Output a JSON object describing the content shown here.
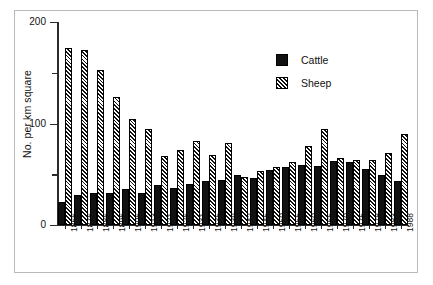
{
  "chart_data": {
    "type": "bar",
    "title": "",
    "xlabel": "",
    "ylabel": "No. per km square",
    "ylim": [
      0,
      200
    ],
    "yticks": [
      0,
      100,
      200
    ],
    "yticks_minor": [
      50,
      150
    ],
    "grid": false,
    "legend_position": "top-right",
    "categories": [
      "1866",
      "1876",
      "1886",
      "1896",
      "1906",
      "1913",
      "1921",
      "1926",
      "1931",
      "1935",
      "1939",
      "1942",
      "1945",
      "1950",
      "1955",
      "1960",
      "1965",
      "1970",
      "1975",
      "1978",
      "1983",
      "1988"
    ],
    "series": [
      {
        "name": "Cattle",
        "color": "#111111",
        "fill": "solid",
        "values": [
          23,
          30,
          32,
          32,
          35,
          32,
          39,
          36,
          40,
          43,
          44,
          49,
          46,
          54,
          57,
          59,
          58,
          63,
          62,
          55,
          49,
          43
        ]
      },
      {
        "name": "Sheep",
        "color": "#111111",
        "fill": "diagonal-hatch",
        "values": [
          174,
          172,
          153,
          126,
          104,
          95,
          68,
          74,
          83,
          69,
          81,
          47,
          53,
          57,
          62,
          78,
          95,
          66,
          64,
          64,
          71,
          90
        ]
      }
    ]
  },
  "legend": {
    "items": [
      {
        "label": "Cattle",
        "swatch": "solid-black-square"
      },
      {
        "label": "Sheep",
        "swatch": "hatched-square"
      }
    ]
  },
  "axes": {
    "y_title": "No. per km square",
    "y_tick_labels": [
      "0",
      "100",
      "200"
    ]
  }
}
